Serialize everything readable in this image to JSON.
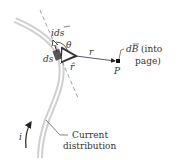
{
  "diagram": {
    "labels": {
      "current_element": "ids",
      "theta": "θ",
      "ds": "ds",
      "r": "r",
      "r_hat": "r̂",
      "point": "P",
      "dB_prefix": "dB",
      "dB_suffix": "(into",
      "dB_suffix2": "page)",
      "current": "i",
      "distribution_line1": "Current",
      "distribution_line2": "distribution"
    },
    "colors": {
      "wire": "#c8c8c8",
      "element": "#555555",
      "text": "#333333",
      "dashed": "#888888"
    }
  }
}
